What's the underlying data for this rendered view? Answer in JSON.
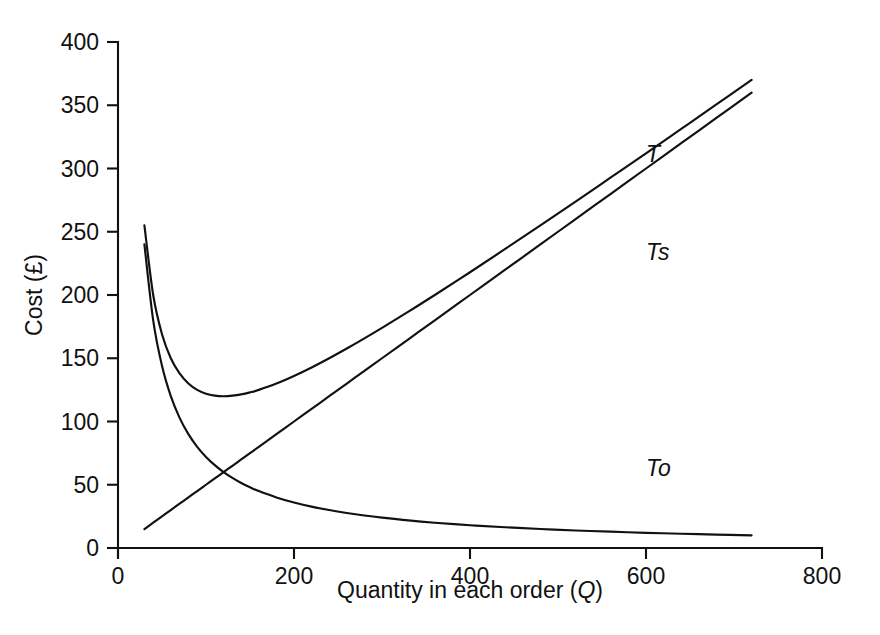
{
  "chart_data": {
    "type": "line",
    "title": "",
    "subtitle": "",
    "xlabel": "Quantity in each order (Q)",
    "xlabel_plain": "Quantity in each order (",
    "xlabel_italic": "Q",
    "xlabel_tail": ")",
    "ylabel": "Cost (£)",
    "xlim": [
      0,
      800
    ],
    "ylim": [
      0,
      400
    ],
    "xticks": [
      0,
      200,
      400,
      600,
      800
    ],
    "xtick_labels": [
      "0",
      "200",
      "400",
      "600",
      "800"
    ],
    "yticks": [
      0,
      50,
      100,
      150,
      200,
      250,
      300,
      350,
      400
    ],
    "ytick_labels": [
      "0",
      "50",
      "100",
      "150",
      "200",
      "250",
      "300",
      "350",
      "400"
    ],
    "grid": false,
    "legend_position": "inline-annotations",
    "line_color": "#111111",
    "background_color": "#ffffff",
    "x": [
      30,
      40,
      50,
      60,
      70,
      80,
      90,
      100,
      110,
      120,
      130,
      140,
      150,
      160,
      180,
      200,
      220,
      240,
      260,
      280,
      300,
      330,
      360,
      400,
      440,
      480,
      520,
      560,
      600,
      640,
      680,
      720
    ],
    "series": [
      {
        "name": "T",
        "label": "T",
        "description": "Total cost (storage + ordering)",
        "label_x": 600,
        "label_y": 305,
        "values": [
          255.0,
          200.0,
          169.0,
          150.0,
          138.0,
          130.0,
          125.0,
          122.0,
          120.5,
          120.0,
          120.4,
          121.4,
          123.0,
          125.0,
          130.0,
          136.0,
          142.7,
          150.0,
          157.7,
          165.7,
          174.0,
          186.8,
          200.0,
          218.0,
          236.4,
          255.0,
          273.8,
          292.9,
          312.0,
          331.3,
          350.6,
          370.0
        ]
      },
      {
        "name": "Ts",
        "label": "Ts",
        "description": "Storage (holding) cost, linear in Q",
        "label_x": 600,
        "label_y": 228,
        "values": [
          15.0,
          20.0,
          25.0,
          30.0,
          35.0,
          40.0,
          45.0,
          50.0,
          55.0,
          60.0,
          65.0,
          70.0,
          75.0,
          80.0,
          90.0,
          100.0,
          110.0,
          120.0,
          130.0,
          140.0,
          150.0,
          165.0,
          180.0,
          200.0,
          220.0,
          240.0,
          260.0,
          280.0,
          300.0,
          320.0,
          340.0,
          360.0
        ]
      },
      {
        "name": "To",
        "label": "To",
        "description": "Ordering cost, inversely proportional to Q",
        "label_x": 600,
        "label_y": 57,
        "values": [
          240.0,
          180.0,
          144.0,
          120.0,
          102.9,
          90.0,
          80.0,
          72.0,
          65.5,
          60.0,
          55.4,
          51.4,
          48.0,
          45.0,
          40.0,
          36.0,
          32.7,
          30.0,
          27.7,
          25.7,
          24.0,
          21.8,
          20.0,
          18.0,
          16.4,
          15.0,
          13.8,
          12.9,
          12.0,
          11.3,
          10.6,
          10.0
        ]
      }
    ],
    "annotations": [
      {
        "text": "T",
        "note": "total cost curve label"
      },
      {
        "text": "Ts",
        "note": "storage cost line label"
      },
      {
        "text": "To",
        "note": "ordering cost curve label"
      }
    ]
  }
}
